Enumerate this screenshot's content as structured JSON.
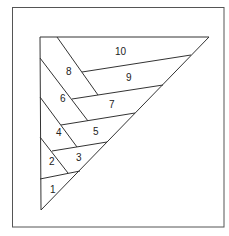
{
  "diagram": {
    "type": "triangle-partition",
    "line_color": "#3a3a3a",
    "background": "#ffffff",
    "frame": {
      "x": 12,
      "y": 7,
      "width": 212,
      "height": 220
    },
    "triangle": {
      "points": [
        [
          40,
          37
        ],
        [
          209,
          37
        ],
        [
          41,
          210
        ]
      ]
    },
    "regions": [
      {
        "label": "1",
        "x": 50,
        "y": 193
      },
      {
        "label": "2",
        "x": 49,
        "y": 165
      },
      {
        "label": "3",
        "x": 76,
        "y": 161
      },
      {
        "label": "4",
        "x": 56,
        "y": 136
      },
      {
        "label": "5",
        "x": 93,
        "y": 135
      },
      {
        "label": "6",
        "x": 60,
        "y": 102
      },
      {
        "label": "7",
        "x": 109,
        "y": 108
      },
      {
        "label": "8",
        "x": 66,
        "y": 75
      },
      {
        "label": "9",
        "x": 126,
        "y": 81
      },
      {
        "label": "10",
        "x": 115,
        "y": 55
      }
    ]
  }
}
